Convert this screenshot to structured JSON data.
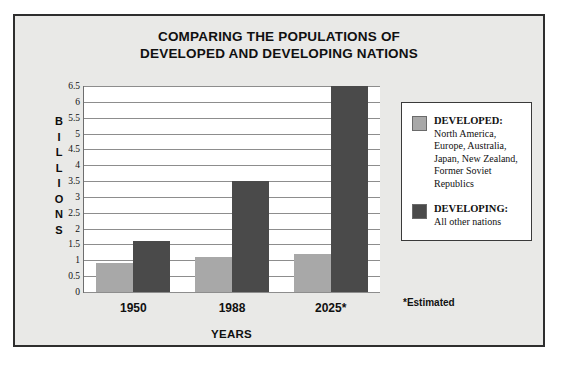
{
  "chart_data": {
    "type": "bar",
    "title": "COMPARING THE POPULATIONS OF DEVELOPED AND DEVELOPING NATIONS",
    "title_lines": [
      "COMPARING THE POPULATIONS OF",
      "DEVELOPED AND DEVELOPING NATIONS"
    ],
    "categories": [
      "1950",
      "1988",
      "2025*"
    ],
    "series": [
      {
        "name": "DEVELOPED",
        "color": "#a8a8a8",
        "values": [
          0.9,
          1.1,
          1.2
        ]
      },
      {
        "name": "DEVELOPING",
        "color": "#4a4a4a",
        "values": [
          1.6,
          3.5,
          6.5
        ]
      }
    ],
    "xlabel": "YEARS",
    "ylabel": "BILLIONS",
    "ylabel_letters": [
      "B",
      "I",
      "L",
      "L",
      "I",
      "O",
      "N",
      "S"
    ],
    "ylim": [
      0,
      6.5
    ],
    "ytick_step": 0.5,
    "yticks": [
      "0",
      "0.5",
      "1",
      "1.5",
      "2",
      "2.5",
      "3",
      "3.5",
      "4",
      "4.5",
      "5",
      "5.5",
      "6",
      "6.5"
    ],
    "grid": true,
    "legend_position": "right",
    "annotations": [
      "*Estimated"
    ]
  },
  "legend": {
    "entries": [
      {
        "heading": "DEVELOPED:",
        "description": "North America, Europe, Australia, Japan, New Zealand, Former Soviet Republics",
        "color": "#a8a8a8"
      },
      {
        "heading": "DEVELOPING:",
        "description": "All other nations",
        "color": "#4a4a4a"
      }
    ]
  },
  "footnote": "*Estimated"
}
